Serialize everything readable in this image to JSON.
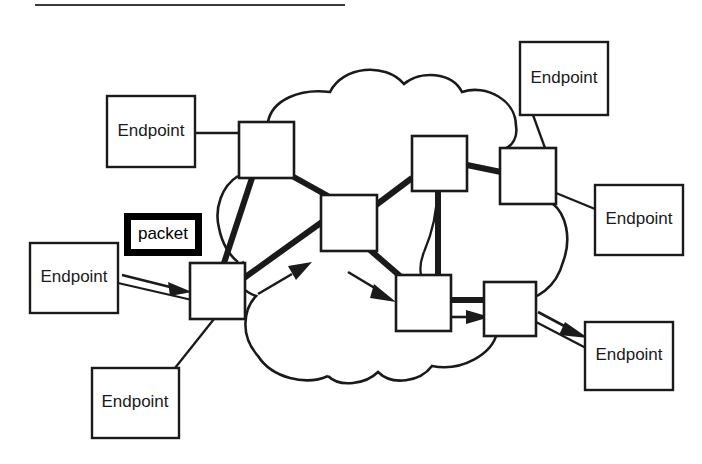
{
  "diagram": {
    "title_rule": "horizontal-rule",
    "type": "network-cloud-diagram",
    "background_color": "#ffffff",
    "line_color": "#1a1a1a",
    "packet_highlight_color": "#000000",
    "endpoints": [
      {
        "id": "endpoint-left-top",
        "label": "Endpoint",
        "x": 107,
        "y": 96,
        "w": 88,
        "h": 71
      },
      {
        "id": "endpoint-left-middle",
        "label": "Endpoint",
        "x": 30,
        "y": 243,
        "w": 88,
        "h": 70
      },
      {
        "id": "endpoint-left-bottom",
        "label": "Endpoint",
        "x": 92,
        "y": 368,
        "w": 87,
        "h": 70
      },
      {
        "id": "endpoint-right-top",
        "label": "Endpoint",
        "x": 520,
        "y": 42,
        "w": 88,
        "h": 73
      },
      {
        "id": "endpoint-right-middle",
        "label": "Endpoint",
        "x": 595,
        "y": 185,
        "w": 88,
        "h": 70
      },
      {
        "id": "endpoint-right-bottom",
        "label": "Endpoint",
        "x": 585,
        "y": 322,
        "w": 88,
        "h": 68
      }
    ],
    "routers": [
      {
        "id": "router-nw",
        "x": 239,
        "y": 122,
        "w": 55,
        "h": 56
      },
      {
        "id": "router-sw",
        "x": 190,
        "y": 263,
        "w": 55,
        "h": 56
      },
      {
        "id": "router-center",
        "x": 321,
        "y": 195,
        "w": 56,
        "h": 56
      },
      {
        "id": "router-n",
        "x": 412,
        "y": 136,
        "w": 55,
        "h": 55
      },
      {
        "id": "router-ne",
        "x": 500,
        "y": 148,
        "w": 56,
        "h": 56
      },
      {
        "id": "router-s",
        "x": 396,
        "y": 275,
        "w": 55,
        "h": 56
      },
      {
        "id": "router-se",
        "x": 484,
        "y": 282,
        "w": 52,
        "h": 54
      }
    ],
    "packet_badge": {
      "label": "packet",
      "x": 124,
      "y": 213,
      "w": 78,
      "h": 43,
      "border_px": 7
    },
    "path_arrows": [
      {
        "id": "arrow-endpoint-to-router-sw",
        "from": "endpoint-left-middle",
        "to": "router-sw"
      },
      {
        "id": "arrow-router-sw-to-center",
        "from": "router-sw",
        "to": "router-center"
      },
      {
        "id": "arrow-center-to-router-s",
        "from": "router-center",
        "to": "router-s"
      },
      {
        "id": "arrow-router-s-to-se",
        "from": "router-s",
        "to": "router-se"
      },
      {
        "id": "arrow-router-se-to-endpoint",
        "from": "router-se",
        "to": "endpoint-right-bottom"
      }
    ],
    "highlighted_route": [
      "endpoint-left-middle",
      "router-sw",
      "router-center",
      "router-s",
      "router-se",
      "endpoint-right-bottom"
    ],
    "top_rule": {
      "x1": 35,
      "y1": 5,
      "x2": 345,
      "y2": 5
    }
  }
}
